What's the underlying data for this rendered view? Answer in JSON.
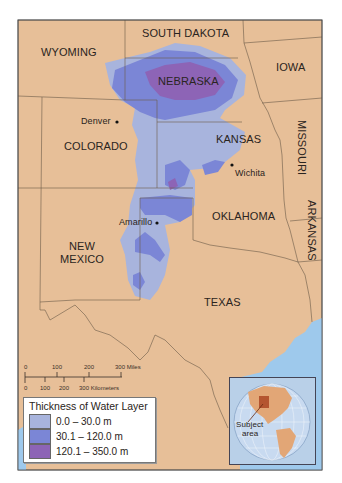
{
  "map": {
    "title": "High Plains (Ogallala) Aquifer",
    "colors": {
      "land": "#e7bf98",
      "water": "#9ec9ec",
      "border": "#6b5a48",
      "thin": "#a8b4dd",
      "medium": "#7b86d6",
      "thick": "#8d64b6"
    },
    "states": [
      {
        "name": "SOUTH DAKOTA"
      },
      {
        "name": "WYOMING"
      },
      {
        "name": "IOWA"
      },
      {
        "name": "NEBRASKA"
      },
      {
        "name": "COLORADO"
      },
      {
        "name": "KANSAS"
      },
      {
        "name": "MISSOURI"
      },
      {
        "name": "OKLAHOMA"
      },
      {
        "name": "ARKANSAS"
      },
      {
        "name": "NEW"
      },
      {
        "name": "MEXICO"
      },
      {
        "name": "TEXAS"
      }
    ],
    "cities": [
      {
        "name": "Denver"
      },
      {
        "name": "Wichita"
      },
      {
        "name": "Amarillo"
      }
    ]
  },
  "scale_bar": {
    "miles_ticks": [
      "0",
      "100",
      "200",
      "300 Miles"
    ],
    "km_ticks": [
      "0",
      "100",
      "200",
      "300 Kilometers"
    ]
  },
  "legend": {
    "title": "Thickness of Water Layer",
    "items": [
      {
        "label": "0.0 – 30.0 m",
        "color": "#a8b4dd"
      },
      {
        "label": "30.1 – 120.0 m",
        "color": "#7b86d6"
      },
      {
        "label": "120.1 – 350.0 m",
        "color": "#8d64b6"
      }
    ]
  },
  "inset": {
    "label_line1": "Subject",
    "label_line2": "area"
  }
}
